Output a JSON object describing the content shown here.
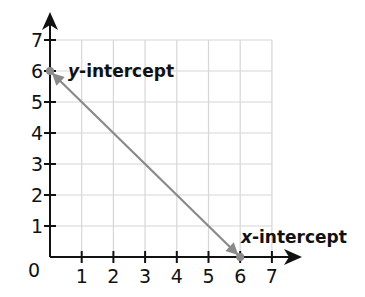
{
  "chart_data": {
    "type": "line",
    "title": "",
    "xlabel": "",
    "ylabel": "",
    "xlim": [
      0,
      7
    ],
    "ylim": [
      0,
      7
    ],
    "grid": true,
    "x_ticks": [
      "1",
      "2",
      "3",
      "4",
      "5",
      "6",
      "7"
    ],
    "y_ticks": [
      "1",
      "2",
      "3",
      "4",
      "5",
      "6",
      "7"
    ],
    "origin_label": "0",
    "series": [
      {
        "name": "line",
        "x": [
          0,
          6
        ],
        "y": [
          6,
          0
        ],
        "color": "#8a8a8a"
      }
    ],
    "annotations": [
      {
        "point": [
          0,
          6
        ],
        "var": "y",
        "text": "-intercept"
      },
      {
        "point": [
          6,
          0
        ],
        "var": "x",
        "text": "-intercept"
      }
    ]
  },
  "colors": {
    "axis": "#111111",
    "grid": "#d6d6d6",
    "line": "#8a8a8a"
  }
}
